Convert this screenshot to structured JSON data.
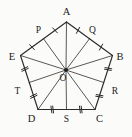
{
  "figure": {
    "type": "geometry-diagram",
    "shape": "regular-pentagon",
    "background_color": "#fbfbfa",
    "stroke_color": "#2b2b2b",
    "radius_color": "#3a3a3a",
    "center": {
      "label": "O",
      "name": "center-point",
      "x": 66,
      "y": 70,
      "label_x": 63,
      "label_y": 81
    },
    "vertices": [
      {
        "label": "A",
        "name": "vertex-a",
        "x": 66.5,
        "y": 22.0,
        "label_x": 66.5,
        "label_y": 14.5,
        "label_anchor": "middle"
      },
      {
        "label": "B",
        "name": "vertex-b",
        "x": 112.5,
        "y": 55.5,
        "label_x": 120.0,
        "label_y": 59.5,
        "label_anchor": "middle"
      },
      {
        "label": "C",
        "name": "vertex-c",
        "x": 95.0,
        "y": 109.5,
        "label_x": 99.5,
        "label_y": 121.5,
        "label_anchor": "middle"
      },
      {
        "label": "D",
        "name": "vertex-d",
        "x": 38.0,
        "y": 109.5,
        "label_x": 31.5,
        "label_y": 121.5,
        "label_anchor": "middle"
      },
      {
        "label": "E",
        "name": "vertex-e",
        "x": 20.5,
        "y": 55.5,
        "label_x": 12.0,
        "label_y": 59.5,
        "label_anchor": "middle"
      }
    ],
    "midpoints": [
      {
        "label": "Q",
        "name": "midpoint-q",
        "on_side": "AB",
        "x": 89.5,
        "y": 38.75,
        "label_x": 92.5,
        "label_y": 32.5,
        "label_anchor": "middle",
        "ticks": 1
      },
      {
        "label": "R",
        "name": "midpoint-r",
        "on_side": "BC",
        "x": 103.75,
        "y": 82.5,
        "label_x": 115.0,
        "label_y": 94.0,
        "label_anchor": "middle",
        "ticks": 2
      },
      {
        "label": "S",
        "name": "midpoint-s",
        "on_side": "CD",
        "x": 66.5,
        "y": 109.5,
        "label_x": 66.5,
        "label_y": 121.5,
        "label_anchor": "middle",
        "ticks": 2
      },
      {
        "label": "T",
        "name": "midpoint-t",
        "on_side": "DE",
        "x": 29.25,
        "y": 82.5,
        "label_x": 17.5,
        "label_y": 94.0,
        "label_anchor": "middle",
        "ticks": 2
      },
      {
        "label": "P",
        "name": "midpoint-p",
        "on_side": "EA",
        "x": 43.5,
        "y": 38.75,
        "label_x": 38.5,
        "label_y": 33.0,
        "label_anchor": "middle",
        "ticks": 1
      }
    ],
    "sides": [
      {
        "name": "side-ab",
        "from": "A",
        "to": "B",
        "midpoint": "Q"
      },
      {
        "name": "side-bc",
        "from": "B",
        "to": "C",
        "midpoint": "R"
      },
      {
        "name": "side-cd",
        "from": "C",
        "to": "D",
        "midpoint": "S"
      },
      {
        "name": "side-de",
        "from": "D",
        "to": "E",
        "midpoint": "T"
      },
      {
        "name": "side-ea",
        "from": "E",
        "to": "A",
        "midpoint": "P"
      }
    ],
    "radii": [
      {
        "name": "radius-oa",
        "to": "A"
      },
      {
        "name": "radius-ob",
        "to": "B"
      },
      {
        "name": "radius-oc",
        "to": "C"
      },
      {
        "name": "radius-od",
        "to": "D"
      },
      {
        "name": "radius-oe",
        "to": "E"
      },
      {
        "name": "radius-op",
        "to": "P"
      },
      {
        "name": "radius-oq",
        "to": "Q"
      },
      {
        "name": "radius-or",
        "to": "R"
      },
      {
        "name": "radius-os",
        "to": "S"
      },
      {
        "name": "radius-ot",
        "to": "T"
      }
    ]
  }
}
